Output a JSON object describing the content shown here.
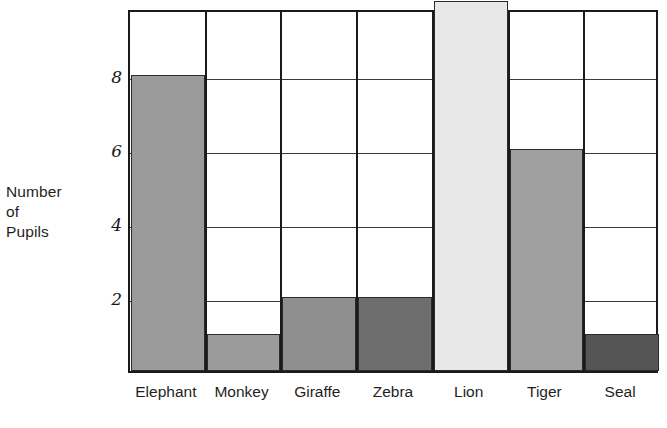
{
  "chart_data": {
    "type": "bar",
    "title": "",
    "xlabel": "",
    "ylabel": "Number of Pupils",
    "categories": [
      "Elephant",
      "Monkey",
      "Giraffe",
      "Zebra",
      "Lion",
      "Tiger",
      "Seal"
    ],
    "values": [
      8,
      1,
      2,
      2,
      10,
      6,
      1
    ],
    "bar_colors": [
      "#9b9b9b",
      "#9b9b9b",
      "#8f8f8f",
      "#6e6e6e",
      "#e8e8e8",
      "#a0a0a0",
      "#555555"
    ],
    "ylim": [
      0,
      9.8
    ],
    "y_ticks": [
      2,
      4,
      6,
      8
    ],
    "y_tick_labels": [
      "2",
      "4",
      "6",
      "8"
    ],
    "grid": true,
    "legend": "none"
  },
  "axis": {
    "y_title_lines": [
      "Number",
      "of",
      "Pupils"
    ]
  },
  "style": {
    "axis_color": "#1a1a1a",
    "grid_color": "#3a3a3a",
    "bar_border_color": "#2a2a2a",
    "background": "#ffffff",
    "text_color": "#1f1f1f"
  }
}
